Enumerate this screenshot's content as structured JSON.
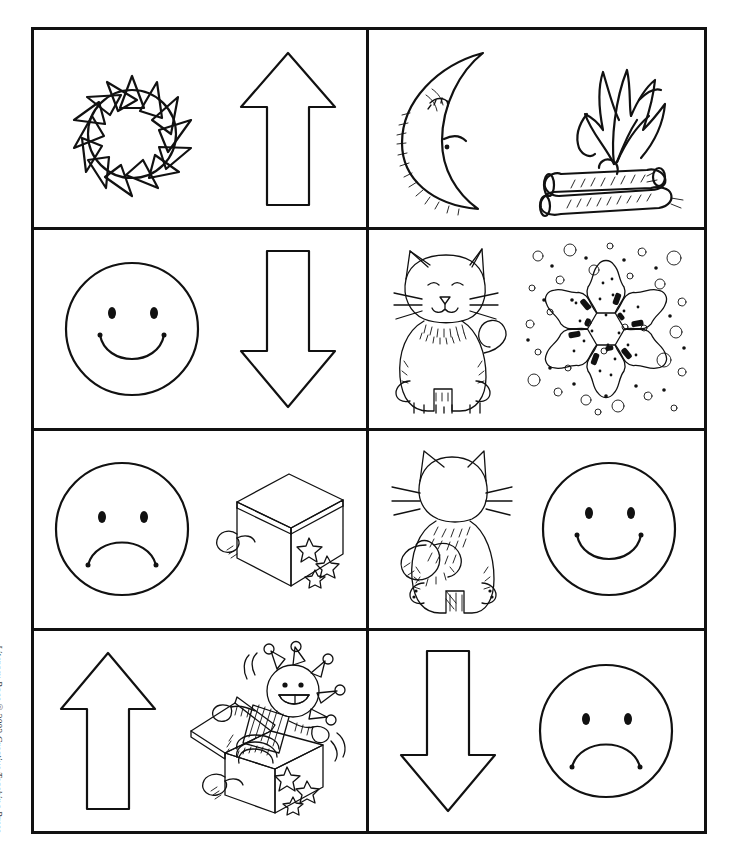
{
  "page": {
    "credit": "Literacy Bags © 2002 Creative Teaching Press",
    "credit_italic_part": "Literacy Bags",
    "credit_rest": " © 2002 Creative Teaching Press",
    "ink_color": "#111111",
    "background_color": "#ffffff",
    "grid_rows": 4,
    "grid_columns": 2
  },
  "cards": [
    {
      "id": "card-1",
      "row": 1,
      "column": 1,
      "left_image": {
        "name": "sun",
        "label": "sun"
      },
      "right_image": {
        "name": "up-arrow",
        "label": "up arrow"
      }
    },
    {
      "id": "card-2",
      "row": 1,
      "column": 2,
      "left_image": {
        "name": "crescent-moon",
        "label": "moon"
      },
      "right_image": {
        "name": "campfire",
        "label": "fire"
      }
    },
    {
      "id": "card-3",
      "row": 2,
      "column": 1,
      "left_image": {
        "name": "happy-face",
        "label": "happy face"
      },
      "right_image": {
        "name": "down-arrow",
        "label": "down arrow"
      }
    },
    {
      "id": "card-4",
      "row": 2,
      "column": 2,
      "left_image": {
        "name": "cat-front",
        "label": "cat facing front"
      },
      "right_image": {
        "name": "snowflake",
        "label": "snow"
      }
    },
    {
      "id": "card-5",
      "row": 3,
      "column": 1,
      "left_image": {
        "name": "sad-face",
        "label": "sad face"
      },
      "right_image": {
        "name": "closed-jack-in-the-box",
        "label": "closed jack-in-the-box"
      }
    },
    {
      "id": "card-6",
      "row": 3,
      "column": 2,
      "left_image": {
        "name": "cat-back",
        "label": "cat facing back"
      },
      "right_image": {
        "name": "happy-face",
        "label": "happy face"
      }
    },
    {
      "id": "card-7",
      "row": 4,
      "column": 1,
      "left_image": {
        "name": "up-arrow",
        "label": "up arrow"
      },
      "right_image": {
        "name": "open-jack-in-the-box",
        "label": "open jack-in-the-box"
      }
    },
    {
      "id": "card-8",
      "row": 4,
      "column": 2,
      "left_image": {
        "name": "down-arrow",
        "label": "down arrow"
      },
      "right_image": {
        "name": "sad-face",
        "label": "sad face"
      }
    }
  ]
}
